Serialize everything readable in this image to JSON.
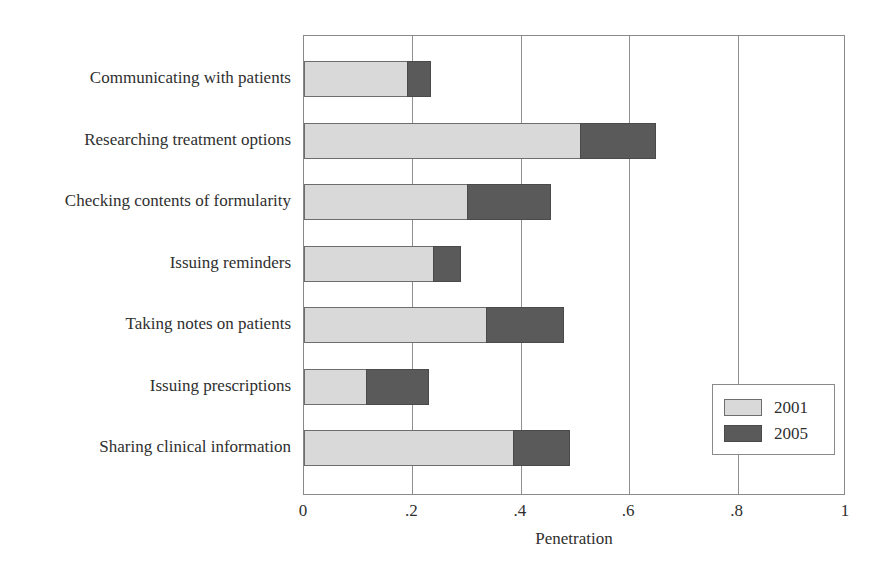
{
  "chart_data": {
    "type": "bar",
    "orientation": "horizontal",
    "stacked": true,
    "title": "",
    "xlabel": "Penetration",
    "ylabel": "",
    "xlim": [
      0,
      1
    ],
    "xticks": [
      "0",
      ".2",
      ".4",
      ".6",
      ".8",
      "1"
    ],
    "xtick_values": [
      0,
      0.2,
      0.4,
      0.6,
      0.8,
      1
    ],
    "grid": true,
    "grid_axis": "x",
    "legend_position": "lower-right-inside",
    "categories": [
      "Communicating with patients",
      "Researching treatment options",
      "Checking contents of formularity",
      "Issuing reminders",
      "Taking notes on patients",
      "Issuing prescriptions",
      "Sharing clinical information"
    ],
    "series": [
      {
        "name": "2001",
        "color": "#d9d9d9",
        "values": [
          0.19,
          0.51,
          0.3,
          0.238,
          0.335,
          0.115,
          0.385
        ]
      },
      {
        "name": "2005",
        "color": "#5a5a5a",
        "values": [
          0.235,
          0.65,
          0.455,
          0.29,
          0.48,
          0.23,
          0.49
        ]
      }
    ],
    "note": "2005 values are cumulative totals; the dark segment is drawn from the 2001 value to the 2005 value."
  },
  "legend": {
    "items": [
      {
        "label": "2001",
        "swatch": "light"
      },
      {
        "label": "2005",
        "swatch": "dark"
      }
    ]
  },
  "axis": {
    "x_title": "Penetration"
  },
  "colors": {
    "series_2001": "#d9d9d9",
    "series_2005": "#5a5a5a",
    "frame": "#8a8a8a",
    "text": "#2f2f2f",
    "background": "#ffffff"
  }
}
